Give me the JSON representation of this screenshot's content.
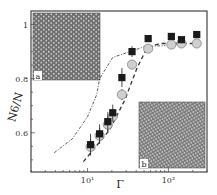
{
  "chart_data": {
    "type": "scatter",
    "title": "",
    "xlabel": "Γ",
    "ylabel": "N6/N",
    "xscale": "log",
    "xlim": [
      2,
      300
    ],
    "ylim": [
      0.455,
      1.05
    ],
    "xticks": [
      {
        "value": 10,
        "label": "10¹"
      },
      {
        "value": 100,
        "label": "10²"
      }
    ],
    "yticks": [
      {
        "value": 0.6,
        "label": "0.6"
      },
      {
        "value": 0.8,
        "label": "0.8"
      },
      {
        "value": 1.0,
        "label": "1"
      }
    ],
    "grid": false,
    "series": [
      {
        "name": "squares",
        "marker": "square",
        "color": "#1a1a1a",
        "x": [
          10.9,
          14.1,
          17.8,
          20.5,
          26.6,
          35.5,
          56.2,
          108.7,
          145,
          224
        ],
        "y": [
          0.556,
          0.596,
          0.641,
          0.674,
          0.804,
          0.9,
          0.948,
          0.956,
          0.944,
          0.963
        ],
        "yerr": [
          0.04,
          0.035,
          0.035,
          0.03,
          0.035,
          0.02,
          0.01,
          0.01,
          0.01,
          0.01
        ]
      },
      {
        "name": "circles",
        "marker": "circle",
        "color": "#cfcfcf",
        "x": [
          10.9,
          14.1,
          17.8,
          20.5,
          26.6,
          35.5,
          56.2,
          108.7,
          145,
          224
        ],
        "y": [
          0.548,
          0.589,
          0.63,
          0.66,
          0.741,
          0.852,
          0.911,
          0.926,
          0.93,
          0.93
        ],
        "yerr": [
          0.03,
          0.03,
          0.03,
          0.02,
          0.02,
          0.01,
          0.01,
          0.01,
          0.01,
          0.01
        ]
      },
      {
        "name": "dash-dot-curve",
        "style": "dashdot",
        "color": "#333333",
        "x": [
          3.87,
          6.5,
          10,
          13,
          14.1,
          20.5,
          51.7,
          91.6
        ],
        "y": [
          0.526,
          0.578,
          0.659,
          0.741,
          0.8,
          0.878,
          0.919,
          0.922
        ]
      },
      {
        "name": "dashed-curve",
        "style": "dashed",
        "color": "#333333",
        "x": [
          8.9,
          18.8,
          29,
          41,
          54.6,
          79,
          224
        ],
        "y": [
          0.493,
          0.611,
          0.722,
          0.84,
          0.915,
          0.93,
          0.93
        ]
      }
    ],
    "annotations": [
      {
        "text": "a",
        "description": "inset snapshot of ordered hexagonal lattice",
        "position": "top-left"
      },
      {
        "text": "b",
        "description": "inset snapshot of disordered lattice",
        "position": "bottom-right"
      }
    ]
  }
}
